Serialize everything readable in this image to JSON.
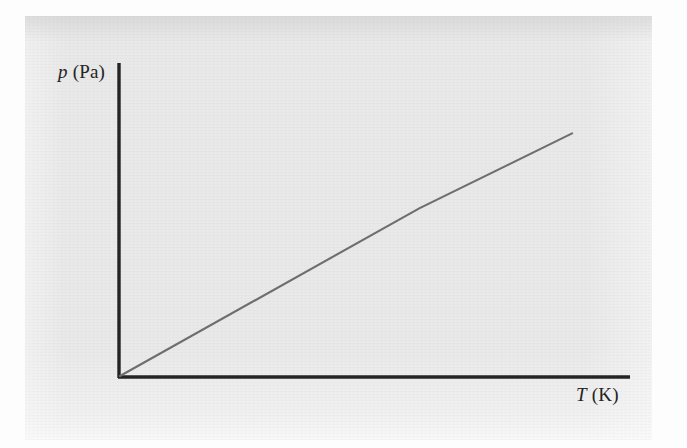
{
  "figure": {
    "type": "line-graph",
    "background_color": "#e9e9e9",
    "page_color": "#fdfdfd",
    "axis_color": "#242424",
    "line_color": "#6e6e6e"
  },
  "axes": {
    "y": {
      "quantity_symbol": "p",
      "unit_text": " (Pa)",
      "full_label": "p (Pa)",
      "name": "pressure"
    },
    "x": {
      "quantity_symbol": "T",
      "unit_text": " (K)",
      "full_label": "T (K)",
      "name": "thermodynamic temperature"
    }
  },
  "chart_data": {
    "type": "line",
    "title": "",
    "subtitle": "",
    "xlabel": "T (K)",
    "ylabel": "p (Pa)",
    "xlim": [
      0,
      1
    ],
    "ylim": [
      0,
      1
    ],
    "grid": false,
    "legend": "none",
    "annotations": [],
    "tick_labels": {
      "x": [],
      "y": []
    },
    "series": [
      {
        "name": "p vs T",
        "style": "straight line through the origin",
        "x": [
          0.0,
          0.59,
          0.89
        ],
        "y": [
          0.0,
          0.54,
          0.78
        ],
        "color": "#6e6e6e"
      }
    ]
  }
}
